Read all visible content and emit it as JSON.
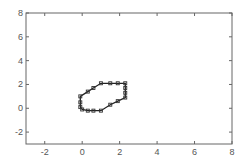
{
  "chart_data": {
    "type": "scatter",
    "title": "",
    "xlabel": "",
    "ylabel": "",
    "xlim": [
      -3,
      8
    ],
    "ylim": [
      -3,
      8
    ],
    "grid": false,
    "legend": null,
    "x_ticks": [
      -2,
      0,
      2,
      4,
      6,
      8
    ],
    "y_ticks": [
      -2,
      0,
      2,
      4,
      6,
      8
    ],
    "series": [
      {
        "name": "boundary",
        "style": "closed polygon with square markers",
        "points": [
          [
            -0.1,
            0.1
          ],
          [
            -0.1,
            0.5
          ],
          [
            -0.1,
            1.0
          ],
          [
            0.3,
            1.4
          ],
          [
            0.6,
            1.7
          ],
          [
            1.0,
            2.1
          ],
          [
            1.5,
            2.1
          ],
          [
            1.9,
            2.1
          ],
          [
            2.3,
            2.1
          ],
          [
            2.3,
            1.7
          ],
          [
            2.3,
            1.3
          ],
          [
            2.3,
            0.9
          ],
          [
            1.9,
            0.6
          ],
          [
            1.5,
            0.3
          ],
          [
            1.0,
            -0.2
          ],
          [
            0.6,
            -0.2
          ],
          [
            0.3,
            -0.2
          ],
          [
            0.0,
            -0.1
          ]
        ]
      }
    ]
  }
}
